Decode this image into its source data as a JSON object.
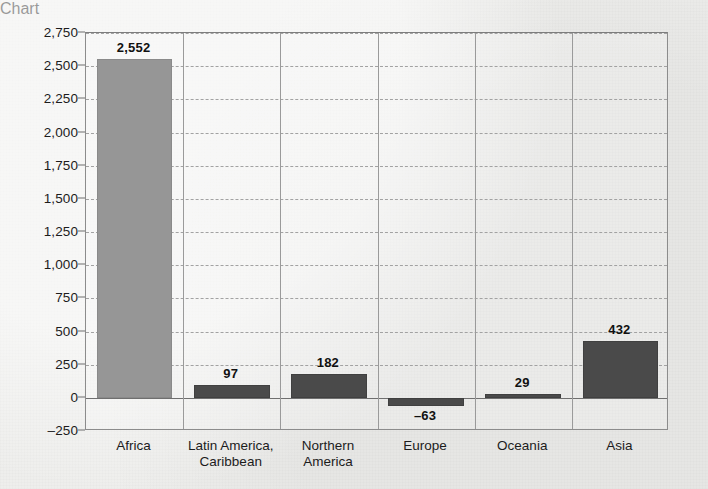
{
  "chart_data": {
    "type": "bar",
    "title": "",
    "subtitle": "",
    "xlabel": "",
    "ylabel": "",
    "categories": [
      "Africa",
      "Latin America, Caribbean",
      "Northern America",
      "Europe",
      "Oceania",
      "Asia"
    ],
    "category_lines": [
      [
        "Africa"
      ],
      [
        "Latin America,",
        "Caribbean"
      ],
      [
        "Northern",
        "America"
      ],
      [
        "Europe"
      ],
      [
        "Oceania"
      ],
      [
        "Asia"
      ]
    ],
    "values": [
      2552,
      97,
      182,
      -63,
      29,
      432
    ],
    "value_labels": [
      "2,552",
      "97",
      "182",
      "–63",
      "29",
      "432"
    ],
    "bar_colors": [
      "#969696",
      "#4a4a4a",
      "#4a4a4a",
      "#4a4a4a",
      "#4a4a4a",
      "#4a4a4a"
    ],
    "ylim": [
      -250,
      2750
    ],
    "ytick_values": [
      2750,
      2500,
      2250,
      2000,
      1750,
      1500,
      1250,
      1000,
      750,
      500,
      250,
      0,
      -250
    ],
    "ytick_labels": [
      "2,750",
      "2,500",
      "2,250",
      "2,000",
      "1,750",
      "1,500",
      "1,250",
      "1,000",
      "750",
      "500",
      "250",
      "0",
      "–250"
    ],
    "grid": true,
    "gridline_style": "dashed",
    "zero_line": 0,
    "legend": null,
    "legend_position": "none",
    "annotations": [],
    "background_color": "#eeeeec",
    "plot_border_color": "#8c8c8c",
    "gridline_color": "#a2a2a2",
    "category_separator_color": "#9a9a9a"
  }
}
